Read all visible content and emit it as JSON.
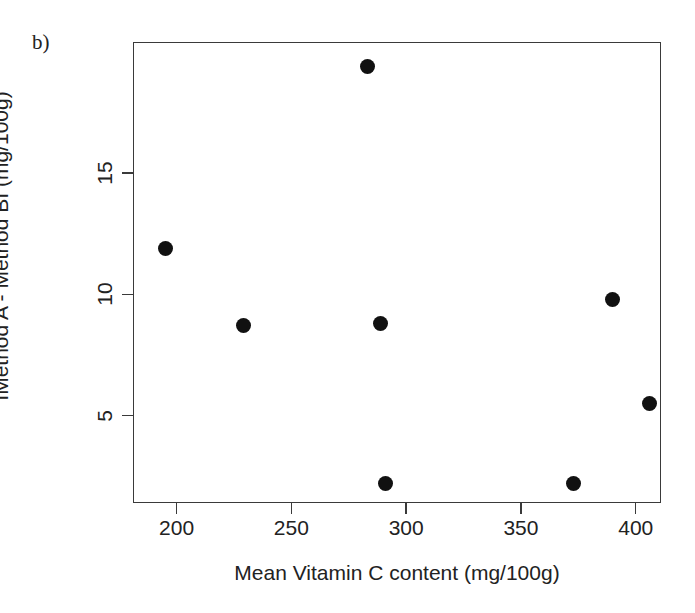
{
  "figure": {
    "panel_label": "b)",
    "background_color": "#ffffff",
    "frame_color": "#3a3a3a",
    "marker_color": "#111111"
  },
  "chart_data": {
    "type": "scatter",
    "title": "",
    "xlabel": "Mean Vitamin C content (mg/100g)",
    "ylabel": "IMethod A - Method BI (mg/100g)",
    "xlim": [
      181,
      411
    ],
    "ylim": [
      1.4,
      20.4
    ],
    "xticks": [
      200,
      250,
      300,
      350,
      400
    ],
    "xtick_labels": [
      "200",
      "250",
      "300",
      "350",
      "400"
    ],
    "yticks": [
      5,
      10,
      15
    ],
    "ytick_labels": [
      "5",
      "10",
      "15"
    ],
    "grid": false,
    "legend": false,
    "series": [
      {
        "name": "Method difference",
        "marker": "filled-circle",
        "color": "#111111",
        "points": [
          {
            "x": 195,
            "y": 11.9
          },
          {
            "x": 229,
            "y": 8.7
          },
          {
            "x": 283,
            "y": 19.4
          },
          {
            "x": 289,
            "y": 8.8
          },
          {
            "x": 291,
            "y": 2.2
          },
          {
            "x": 373,
            "y": 2.2
          },
          {
            "x": 390,
            "y": 9.8
          },
          {
            "x": 406,
            "y": 5.5
          }
        ]
      }
    ]
  }
}
